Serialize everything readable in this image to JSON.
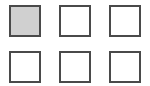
{
  "grid": {
    "rows": 2,
    "columns": 3,
    "tiles": [
      {
        "id": 1,
        "row": 0,
        "col": 0,
        "selected": true
      },
      {
        "id": 2,
        "row": 0,
        "col": 1,
        "selected": false
      },
      {
        "id": 3,
        "row": 0,
        "col": 2,
        "selected": false
      },
      {
        "id": 4,
        "row": 1,
        "col": 0,
        "selected": false
      },
      {
        "id": 5,
        "row": 1,
        "col": 1,
        "selected": false
      },
      {
        "id": 6,
        "row": 1,
        "col": 2,
        "selected": false
      }
    ]
  },
  "colors": {
    "border": "#4a4a4a",
    "selected_fill": "#d0d0d0",
    "fill": "#ffffff"
  }
}
